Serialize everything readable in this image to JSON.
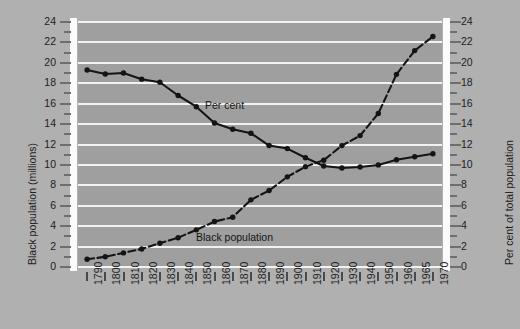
{
  "chart_data": {
    "type": "line",
    "title": "",
    "xlabel": "",
    "ylabel": "Black population (millions)",
    "y2label": "Per cent of total population",
    "ylim": [
      0,
      24
    ],
    "y2lim": [
      0,
      24
    ],
    "ytick_step": 2,
    "grid": true,
    "legend": "inline-annotations",
    "x": [
      1790,
      1800,
      1810,
      1820,
      1830,
      1840,
      1850,
      1860,
      1870,
      1880,
      1890,
      1900,
      1910,
      1920,
      1930,
      1940,
      1950,
      1960,
      1965,
      1970
    ],
    "xtick_labels": [
      "1790",
      "1800",
      "1810",
      "1820",
      "1830",
      "1840",
      "1850",
      "1860",
      "1870",
      "1880",
      "1890",
      "1900",
      "1910",
      "1920",
      "1930",
      "1940",
      "1950",
      "1960",
      "1965",
      "1970"
    ],
    "series": [
      {
        "name": "Black population",
        "axis": "left",
        "units": "millions",
        "style": "dashed",
        "marker": "filled-circle",
        "color": "#141414",
        "label_text": "Black population",
        "values": [
          0.76,
          1.0,
          1.38,
          1.77,
          2.33,
          2.87,
          3.64,
          4.45,
          4.88,
          6.58,
          7.49,
          8.83,
          9.83,
          10.46,
          11.89,
          12.87,
          15.04,
          18.87,
          21.2,
          22.58
        ]
      },
      {
        "name": "Per cent",
        "axis": "right",
        "units": "per cent of total population",
        "style": "solid",
        "marker": "filled-circle",
        "color": "#141414",
        "label_text": "Per cent",
        "values": [
          19.3,
          18.9,
          19.0,
          18.4,
          18.1,
          16.8,
          15.7,
          14.1,
          13.5,
          13.1,
          11.9,
          11.6,
          10.7,
          9.9,
          9.7,
          9.8,
          10.0,
          10.5,
          10.8,
          11.1
        ]
      }
    ],
    "annotations": [
      {
        "text": "Per cent",
        "series": "Per cent"
      },
      {
        "text": "Black population",
        "series": "Black population"
      }
    ],
    "colors": {
      "background": "#b0b0b0",
      "plot_background": "#9f9f9f",
      "gridline": "#f2f2f2",
      "axis_bar": "#fbfbfb",
      "line": "#141414",
      "text": "#1d1d1d"
    }
  }
}
